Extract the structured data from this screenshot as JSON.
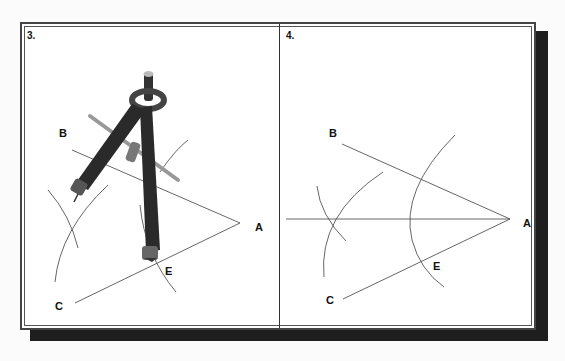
{
  "figure": {
    "panels": [
      {
        "number": "3.",
        "labels": {
          "a": "A",
          "b": "B",
          "c": "C",
          "e": "E"
        },
        "description": "Compass placed with point at E drawing an arc across line AC"
      },
      {
        "number": "4.",
        "labels": {
          "a": "A",
          "b": "B",
          "c": "C",
          "e": "E"
        },
        "description": "Intersecting arcs and the bisector line through A"
      }
    ],
    "colors": {
      "line": "#555555",
      "frame": "#444444",
      "shadow": "#1e1e1e",
      "compass": "#2a2a2a"
    }
  }
}
